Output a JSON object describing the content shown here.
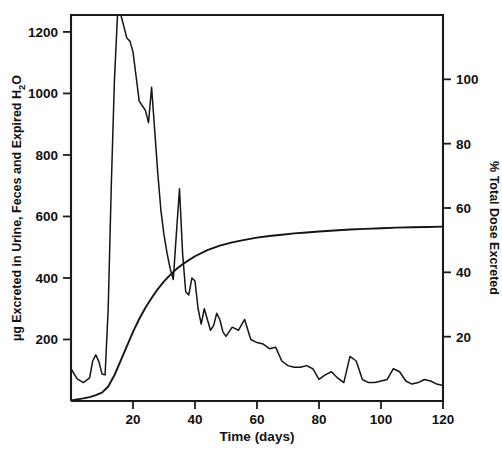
{
  "chart_data": {
    "type": "line",
    "title": "",
    "xlabel": "Time (days)",
    "ylabel": "µg Excreted in Urine, Feces and Expired H2O",
    "ylabel_right": "% Total Dose Excreted",
    "xlim": [
      0,
      120
    ],
    "ylim": [
      0,
      1255
    ],
    "ylim_right": [
      0,
      120
    ],
    "grid": false,
    "legend": false,
    "xticks": [
      20,
      40,
      60,
      80,
      100,
      120
    ],
    "xtick_labels": [
      "20",
      "40",
      "60",
      "80",
      "100",
      "120"
    ],
    "yticks": [
      200,
      400,
      600,
      800,
      1000,
      1200
    ],
    "ytick_labels": [
      "200",
      "400",
      "600",
      "800",
      "1000",
      "1200"
    ],
    "yticks_right": [
      20,
      40,
      60,
      80,
      100
    ],
    "ytick_labels_right": [
      "20",
      "40",
      "60",
      "80",
      "100"
    ],
    "series": [
      {
        "name": "Daily excretion",
        "axis": "left",
        "units": "µg",
        "x": [
          0,
          2,
          4,
          6,
          7,
          8,
          9,
          10,
          11,
          12,
          13,
          14,
          15,
          16,
          17,
          18,
          19,
          20,
          21,
          22,
          23,
          24,
          25,
          26,
          27,
          28,
          29,
          30,
          31,
          32,
          33,
          34,
          35,
          36,
          37,
          38,
          39,
          40,
          41,
          42,
          43,
          44,
          45,
          46,
          47,
          48,
          49,
          50,
          52,
          54,
          56,
          58,
          60,
          62,
          64,
          66,
          68,
          70,
          72,
          74,
          76,
          78,
          80,
          82,
          84,
          86,
          88,
          90,
          92,
          94,
          96,
          98,
          100,
          102,
          104,
          106,
          108,
          110,
          112,
          114,
          116,
          118,
          120
        ],
        "y": [
          105,
          72,
          60,
          75,
          130,
          150,
          128,
          88,
          85,
          300,
          700,
          1040,
          1255,
          1258,
          1220,
          1180,
          1170,
          1135,
          1055,
          975,
          960,
          945,
          905,
          1020,
          880,
          740,
          620,
          540,
          480,
          430,
          395,
          545,
          690,
          480,
          355,
          345,
          400,
          390,
          300,
          250,
          300,
          265,
          230,
          245,
          285,
          265,
          225,
          210,
          240,
          230,
          265,
          200,
          190,
          185,
          170,
          175,
          130,
          115,
          110,
          110,
          115,
          105,
          70,
          85,
          95,
          75,
          60,
          145,
          130,
          70,
          60,
          60,
          65,
          70,
          105,
          95,
          65,
          55,
          60,
          70,
          65,
          55,
          50
        ]
      },
      {
        "name": "Cumulative % total dose excreted",
        "axis": "right",
        "units": "%",
        "x": [
          0,
          2,
          4,
          6,
          8,
          10,
          12,
          14,
          16,
          18,
          20,
          22,
          24,
          26,
          28,
          30,
          32,
          34,
          36,
          38,
          40,
          44,
          48,
          52,
          56,
          60,
          64,
          68,
          72,
          76,
          80,
          85,
          90,
          95,
          100,
          105,
          110,
          115,
          120
        ],
        "y": [
          0.2,
          0.5,
          0.8,
          1.2,
          1.8,
          2.6,
          4.5,
          8.0,
          12.5,
          17.0,
          21.5,
          25.5,
          29.0,
          32.0,
          34.8,
          37.2,
          39.2,
          41.0,
          42.5,
          43.8,
          45.0,
          46.9,
          48.3,
          49.3,
          50.1,
          50.8,
          51.3,
          51.7,
          52.1,
          52.4,
          52.7,
          53.0,
          53.3,
          53.5,
          53.7,
          53.9,
          54.0,
          54.1,
          54.2
        ]
      }
    ]
  }
}
